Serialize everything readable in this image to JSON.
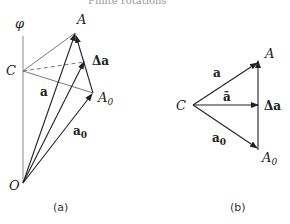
{
  "header": {
    "title": "Finite rotations"
  },
  "figure_a": {
    "caption": "(a)",
    "labels": {
      "phi": "φ",
      "A": "A",
      "C": "C",
      "delta_a": "Δa",
      "a": "a",
      "A0": "A",
      "A0_sub": "0",
      "a0": "a",
      "a0_sub": "0",
      "O": "O"
    }
  },
  "figure_b": {
    "caption": "(b)",
    "labels": {
      "A": "A",
      "C": "C",
      "a": "a",
      "a_bar": "ā",
      "delta_a": "Δa",
      "a0": "a",
      "a0_sub": "0",
      "A0": "A",
      "A0_sub": "0"
    }
  },
  "colors": {
    "line": "#333333",
    "light_line": "#888888"
  }
}
